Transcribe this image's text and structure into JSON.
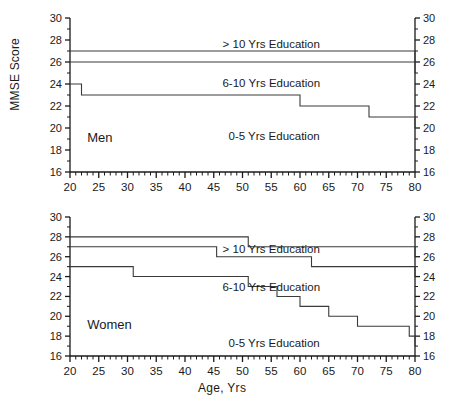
{
  "chart_data": [
    {
      "type": "line",
      "title": "Men",
      "xlabel": "",
      "ylabel": "MMSE Score",
      "xlim": [
        20,
        80
      ],
      "ylim": [
        16,
        30
      ],
      "xticks": [
        20,
        25,
        30,
        35,
        40,
        45,
        50,
        55,
        60,
        65,
        70,
        75,
        80
      ],
      "yticks": [
        16,
        18,
        20,
        22,
        24,
        26,
        28,
        30
      ],
      "grid": false,
      "legend_position": "inline-annotations",
      "step_style": "post",
      "axes": {
        "left_axis": true,
        "right_axis": true,
        "right_tick_labels": [
          16,
          18,
          20,
          22,
          24,
          26,
          28,
          30
        ],
        "minor_tick_interval": 1
      },
      "series": [
        {
          "name": "> 10 Yrs Education",
          "label": "> 10 Yrs Education",
          "label_x": 55,
          "label_y": 27.6,
          "x": [
            20,
            79,
            80
          ],
          "y": [
            27,
            27,
            26
          ]
        },
        {
          "name": "6-10 Yrs Education",
          "label": "6-10 Yrs Education",
          "label_x": 55,
          "label_y": 24.1,
          "x": [
            20,
            53,
            80
          ],
          "y": [
            26,
            26,
            25
          ]
        },
        {
          "name": "0-5 Yrs Education",
          "label": "0-5 Yrs Education",
          "label_x": 55.5,
          "label_y": 19.3,
          "x": [
            20,
            22,
            44,
            60,
            72,
            80
          ],
          "y": [
            24,
            23,
            23,
            22,
            21,
            20
          ]
        }
      ],
      "annotations": [
        {
          "text": "Men",
          "x": 23,
          "y": 19.1
        }
      ]
    },
    {
      "type": "line",
      "title": "Women",
      "xlabel": "Age, Yrs",
      "ylabel": "MMSE Score",
      "xlim": [
        20,
        80
      ],
      "ylim": [
        16,
        30
      ],
      "xticks": [
        20,
        25,
        30,
        35,
        40,
        45,
        50,
        55,
        60,
        65,
        70,
        75,
        80
      ],
      "yticks": [
        16,
        18,
        20,
        22,
        24,
        26,
        28,
        30
      ],
      "grid": false,
      "legend_position": "inline-annotations",
      "step_style": "post",
      "axes": {
        "left_axis": true,
        "right_axis": true,
        "right_tick_labels": [
          16,
          18,
          20,
          22,
          24,
          26,
          28,
          30
        ],
        "minor_tick_interval": 1
      },
      "series": [
        {
          "name": "> 10 Yrs Education",
          "label": "> 10 Yrs Education",
          "label_x": 55,
          "label_y": 26.8,
          "x": [
            20,
            34,
            51,
            80
          ],
          "y": [
            28,
            28,
            27,
            26
          ]
        },
        {
          "name": "6-10 Yrs Education",
          "label": "6-10 Yrs Education",
          "label_x": 55,
          "label_y": 22.9,
          "x": [
            20,
            29,
            45.5,
            62,
            80
          ],
          "y": [
            27,
            27,
            26,
            25,
            24
          ]
        },
        {
          "name": "0-5 Yrs Education",
          "label": "0-5 Yrs Education",
          "label_x": 55.5,
          "label_y": 17.3,
          "x": [
            20,
            31,
            45,
            51,
            56,
            60,
            65,
            70,
            79,
            80
          ],
          "y": [
            25,
            24,
            24,
            23,
            22,
            21,
            20,
            19,
            18,
            17
          ]
        }
      ],
      "annotations": [
        {
          "text": "Women",
          "x": 23,
          "y": 19.1
        }
      ]
    }
  ],
  "panels": {
    "men": {
      "ylabel": "MMSE Score",
      "panel_title": "Men",
      "series_labels": [
        "> 10 Yrs Education",
        "6-10 Yrs Education",
        "0-5 Yrs Education"
      ],
      "ytick_labels": [
        "30",
        "28",
        "26",
        "24",
        "22",
        "20",
        "18",
        "16"
      ],
      "xtick_labels": [
        "20",
        "25",
        "30",
        "35",
        "40",
        "45",
        "50",
        "55",
        "60",
        "65",
        "70",
        "75",
        "80"
      ],
      "ytick_labels_right": [
        "30",
        "28",
        "26",
        "24",
        "22",
        "20",
        "18",
        "16"
      ]
    },
    "women": {
      "ylabel": "MMSE Score",
      "panel_title": "Women",
      "xlabel": "Age, Yrs",
      "series_labels": [
        "> 10 Yrs Education",
        "6-10 Yrs Education",
        "0-5 Yrs Education"
      ],
      "ytick_labels": [
        "30",
        "28",
        "26",
        "24",
        "22",
        "20",
        "18",
        "16"
      ],
      "xtick_labels": [
        "20",
        "25",
        "30",
        "35",
        "40",
        "45",
        "50",
        "55",
        "60",
        "65",
        "70",
        "75",
        "80"
      ],
      "ytick_labels_right": [
        "30",
        "28",
        "26",
        "24",
        "22",
        "20",
        "18",
        "16"
      ]
    }
  },
  "colors": {
    "line": "#3a3a3a",
    "axis": "#1a1a1a",
    "text": "#1a1a1a",
    "background": "#ffffff"
  }
}
